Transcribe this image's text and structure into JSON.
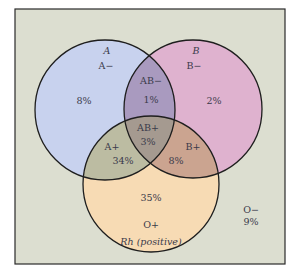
{
  "diagram": {
    "type": "venn",
    "frame": {
      "background": "#dcded0",
      "border": "#2a2a2a"
    },
    "sets": [
      {
        "id": "A",
        "label": "A",
        "color": "#c8d2ee"
      },
      {
        "id": "B",
        "label": "B",
        "color": "#dfb2cf"
      },
      {
        "id": "Rh",
        "label": "Rh (positive)",
        "color": "#f7dbb4"
      }
    ],
    "regions": [
      {
        "id": "a_neg",
        "type": "A−",
        "percent": "8%"
      },
      {
        "id": "b_neg",
        "type": "B−",
        "percent": "2%"
      },
      {
        "id": "ab_neg",
        "type": "AB−",
        "percent": "1%"
      },
      {
        "id": "ab_pos",
        "type": "AB+",
        "percent": "3%"
      },
      {
        "id": "a_pos",
        "type": "A+",
        "percent": "34%"
      },
      {
        "id": "b_pos",
        "type": "B+",
        "percent": "8%"
      },
      {
        "id": "o_pos",
        "type": "O+",
        "percent": "35%"
      },
      {
        "id": "o_neg",
        "type": "O−",
        "percent": "9%"
      }
    ],
    "overlap_colors": {
      "ab_neg": "#a99abf",
      "a_pos": "#bcbca2",
      "b_pos": "#cba490",
      "ab_pos": "#a59a90"
    }
  }
}
